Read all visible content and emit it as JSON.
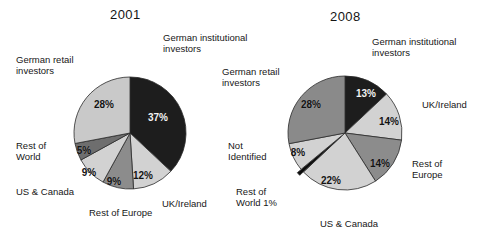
{
  "chart_data": [
    {
      "type": "pie",
      "title": "2001",
      "xlabel": "",
      "ylabel": "",
      "legend_position": "callout-labels",
      "grid": false,
      "unit": "%",
      "categories": [
        "German institutional investors",
        "UK/Ireland",
        "Rest of Europe",
        "US & Canada",
        "Rest of World",
        "German retail investors"
      ],
      "values": [
        37,
        12,
        9,
        9,
        5,
        28
      ],
      "labels": [
        "37%",
        "12%",
        "9%",
        "9%",
        "5%",
        "28%"
      ],
      "colors": [
        "#1d1d1d",
        "#d2d2d2",
        "#8c8c8c",
        "#d2d2d2",
        "#6e6e6e",
        "#c9c9c9"
      ],
      "exploded": [
        false,
        false,
        false,
        false,
        false,
        false
      ]
    },
    {
      "type": "pie",
      "title": "2008",
      "xlabel": "",
      "ylabel": "",
      "legend_position": "callout-labels",
      "grid": false,
      "unit": "%",
      "categories": [
        "German institutional investors",
        "UK/Ireland",
        "Rest of Europe",
        "US & Canada",
        "Rest of World",
        "Not Identified",
        "German retail investors"
      ],
      "values": [
        13,
        14,
        14,
        22,
        1,
        8,
        28
      ],
      "labels": [
        "13%",
        "14%",
        "14%",
        "22%",
        "1%",
        "8%",
        "28%"
      ],
      "colors": [
        "#1d1d1d",
        "#d2d2d2",
        "#8c8c8c",
        "#d2d2d2",
        "#0d0d0d",
        "#d2d2d2",
        "#8a8a8a"
      ],
      "exploded": [
        false,
        false,
        false,
        false,
        true,
        false,
        false
      ]
    }
  ],
  "chart2001": {
    "title": "2001",
    "callouts": {
      "institutional": "German institutional investors",
      "retail": "German retail investors",
      "rest_of_world": "Rest of World",
      "us_canada": "US & Canada",
      "rest_of_europe": "Rest of Europe",
      "uk_ireland": "UK/Ireland"
    },
    "values": {
      "institutional": "37%",
      "uk_ireland": "12%",
      "rest_of_europe": "9%",
      "us_canada": "9%",
      "rest_of_world": "5%",
      "retail": "28%"
    }
  },
  "chart2008": {
    "title": "2008",
    "callouts": {
      "institutional": "German institutional investors",
      "retail": "German retail investors",
      "not_identified": "Not Identified",
      "rest_of_world": "Rest of World 1%",
      "us_canada": "US & Canada",
      "rest_of_europe": "Rest of Europe",
      "uk_ireland": "UK/Ireland"
    },
    "values": {
      "institutional": "13%",
      "uk_ireland": "14%",
      "rest_of_europe": "14%",
      "us_canada": "22%",
      "not_identified": "8%",
      "retail": "28%"
    }
  }
}
